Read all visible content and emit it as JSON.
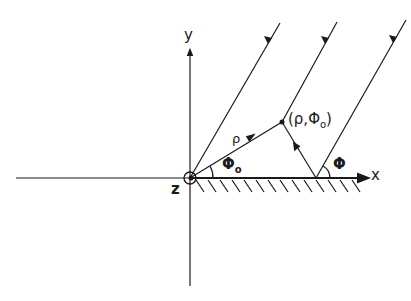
{
  "diagram": {
    "axes": {
      "x_label": "x",
      "y_label": "y",
      "z_label": "z"
    },
    "labels": {
      "rho": "ρ",
      "point": "(ρ,Φ",
      "point_sub": "o",
      "point_close": ")",
      "phi0": "Φ",
      "phi0_sub": "o",
      "phi": "Φ"
    },
    "rays": [
      {
        "name": "incident-ray-1",
        "from": [
          280,
          23
        ],
        "to": [
          190,
          178
        ]
      },
      {
        "name": "incident-ray-2",
        "from": [
          337,
          22
        ],
        "to": [
          282,
          122
        ]
      },
      {
        "name": "incident-ray-3",
        "from": [
          406,
          20
        ],
        "to": [
          316,
          178
        ]
      },
      {
        "name": "reflected-ray",
        "from": [
          316,
          178
        ],
        "to": [
          282,
          122
        ]
      },
      {
        "name": "radius-vector-rho",
        "from": [
          190,
          178
        ],
        "to": [
          282,
          122
        ]
      }
    ],
    "colors": {
      "ink": "#1a1a1a",
      "background": "#ffffff"
    }
  }
}
